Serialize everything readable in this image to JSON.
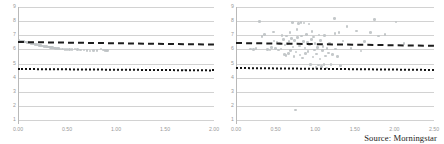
{
  "figure": {
    "source_note": "Source: Morningstar",
    "background": "#ffffff",
    "point_color": "#bfc3c6",
    "trend_color": "#1d1d1d",
    "grid_color": "#d2d2d2"
  },
  "chart_data": [
    {
      "id": "left-panel",
      "type": "scatter",
      "title": "",
      "xlabel": "",
      "ylabel": "",
      "xlim": [
        0.0,
        2.0
      ],
      "ylim": [
        1,
        9
      ],
      "grid": true,
      "legend": "none",
      "xticks": [
        "0.00",
        "0.50",
        "1.00",
        "1.50",
        "2.00"
      ],
      "xtick_values": [
        0.0,
        0.5,
        1.0,
        1.5,
        2.0
      ],
      "yticks": [
        "9",
        "8",
        "7",
        "6",
        "5",
        "4",
        "3",
        "2",
        "1"
      ],
      "ytick_values": [
        9,
        8,
        7,
        6,
        5,
        4,
        3,
        2,
        1
      ],
      "series": [
        {
          "name": "observations",
          "marker": "circle",
          "points": [
            [
              0.012,
              6.62
            ],
            [
              0.022,
              6.6
            ],
            [
              0.031,
              6.58
            ],
            [
              0.04,
              6.57
            ],
            [
              0.05,
              6.55
            ],
            [
              0.06,
              6.54
            ],
            [
              0.07,
              6.52
            ],
            [
              0.079,
              6.51
            ],
            [
              0.09,
              6.49
            ],
            [
              0.1,
              6.47
            ],
            [
              0.11,
              6.46
            ],
            [
              0.12,
              6.44
            ],
            [
              0.131,
              6.42
            ],
            [
              0.141,
              6.41
            ],
            [
              0.152,
              6.39
            ],
            [
              0.162,
              6.37
            ],
            [
              0.173,
              6.36
            ],
            [
              0.183,
              6.34
            ],
            [
              0.193,
              6.33
            ],
            [
              0.204,
              6.31
            ],
            [
              0.214,
              6.29
            ],
            [
              0.225,
              6.28
            ],
            [
              0.235,
              6.26
            ],
            [
              0.246,
              6.25
            ],
            [
              0.256,
              6.23
            ],
            [
              0.267,
              6.22
            ],
            [
              0.277,
              6.21
            ],
            [
              0.288,
              6.19
            ],
            [
              0.298,
              6.18
            ],
            [
              0.309,
              6.17
            ],
            [
              0.32,
              6.16
            ],
            [
              0.33,
              6.14
            ],
            [
              0.341,
              6.13
            ],
            [
              0.352,
              6.12
            ],
            [
              0.363,
              6.11
            ],
            [
              0.374,
              6.1
            ],
            [
              0.385,
              6.08
            ],
            [
              0.396,
              6.07
            ],
            [
              0.407,
              6.06
            ],
            [
              0.418,
              6.05
            ],
            [
              0.43,
              6.04
            ],
            [
              0.455,
              6.02
            ],
            [
              0.478,
              6.01
            ],
            [
              0.5,
              5.99
            ],
            [
              0.527,
              6.0
            ],
            [
              0.553,
              5.98
            ],
            [
              0.58,
              6.02
            ],
            [
              0.61,
              6.0
            ],
            [
              0.64,
              5.96
            ],
            [
              0.672,
              5.95
            ],
            [
              0.705,
              5.92
            ],
            [
              0.735,
              5.88
            ],
            [
              0.77,
              5.9
            ],
            [
              0.805,
              5.93
            ],
            [
              0.848,
              6.03
            ],
            [
              0.872,
              5.95
            ],
            [
              0.888,
              5.93
            ],
            [
              0.902,
              5.92
            ],
            [
              0.915,
              5.94
            ],
            [
              1.7,
              4.55
            ]
          ]
        }
      ],
      "reference_lines": [
        {
          "name": "mean-line",
          "style": "dashed",
          "y_start": 6.58,
          "y_end": 6.4
        },
        {
          "name": "threshold-line",
          "style": "dotted",
          "y_start": 4.68,
          "y_end": 4.58
        }
      ]
    },
    {
      "id": "right-panel",
      "type": "scatter",
      "title": "",
      "xlabel": "",
      "ylabel": "",
      "xlim": [
        0.0,
        2.5
      ],
      "ylim": [
        1,
        9
      ],
      "grid": true,
      "legend": "none",
      "xticks": [
        "0.00",
        "0.50",
        "1.00",
        "1.50",
        "2.00",
        "2.50"
      ],
      "xtick_values": [
        0.0,
        0.5,
        1.0,
        1.5,
        2.0,
        2.5
      ],
      "yticks": [
        "9",
        "8",
        "7",
        "6",
        "5",
        "4",
        "3",
        "2",
        "1"
      ],
      "ytick_values": [
        9,
        8,
        7,
        6,
        5,
        4,
        3,
        2,
        1
      ],
      "series": [
        {
          "name": "observations",
          "marker": "circle",
          "points": [
            [
              0.18,
              6.04
            ],
            [
              0.22,
              5.98
            ],
            [
              0.25,
              6.05
            ],
            [
              0.3,
              7.96
            ],
            [
              0.33,
              6.92
            ],
            [
              0.36,
              7.05
            ],
            [
              0.4,
              6.0
            ],
            [
              0.43,
              5.96
            ],
            [
              0.45,
              6.12
            ],
            [
              0.47,
              7.22
            ],
            [
              0.48,
              6.6
            ],
            [
              0.5,
              6.05
            ],
            [
              0.52,
              6.52
            ],
            [
              0.54,
              5.95
            ],
            [
              0.55,
              6.42
            ],
            [
              0.57,
              6.02
            ],
            [
              0.58,
              7.0
            ],
            [
              0.6,
              6.68
            ],
            [
              0.61,
              5.62
            ],
            [
              0.62,
              6.3
            ],
            [
              0.63,
              5.55
            ],
            [
              0.64,
              6.95
            ],
            [
              0.65,
              6.4
            ],
            [
              0.66,
              5.7
            ],
            [
              0.67,
              6.55
            ],
            [
              0.68,
              7.2
            ],
            [
              0.69,
              5.92
            ],
            [
              0.7,
              6.75
            ],
            [
              0.71,
              7.92
            ],
            [
              0.72,
              6.18
            ],
            [
              0.73,
              5.48
            ],
            [
              0.74,
              6.62
            ],
            [
              0.75,
              1.72
            ],
            [
              0.76,
              5.8
            ],
            [
              0.77,
              7.4
            ],
            [
              0.78,
              6.85
            ],
            [
              0.79,
              7.85
            ],
            [
              0.8,
              6.25
            ],
            [
              0.81,
              5.6
            ],
            [
              0.82,
              7.9
            ],
            [
              0.83,
              6.95
            ],
            [
              0.84,
              5.38
            ],
            [
              0.85,
              6.55
            ],
            [
              0.86,
              7.88
            ],
            [
              0.87,
              6.1
            ],
            [
              0.88,
              5.72
            ],
            [
              0.89,
              7.05
            ],
            [
              0.9,
              6.48
            ],
            [
              0.91,
              5.85
            ],
            [
              0.92,
              7.8
            ],
            [
              0.93,
              6.3
            ],
            [
              0.94,
              4.95
            ],
            [
              0.95,
              6.7
            ],
            [
              0.96,
              7.28
            ],
            [
              0.97,
              5.45
            ],
            [
              0.98,
              6.88
            ],
            [
              0.99,
              5.95
            ],
            [
              1.0,
              6.4
            ],
            [
              1.01,
              4.72
            ],
            [
              1.02,
              5.68
            ],
            [
              1.03,
              6.15
            ],
            [
              1.04,
              4.88
            ],
            [
              1.05,
              7.02
            ],
            [
              1.06,
              5.32
            ],
            [
              1.07,
              6.62
            ],
            [
              1.08,
              4.8
            ],
            [
              1.09,
              5.9
            ],
            [
              1.1,
              6.22
            ],
            [
              1.11,
              4.95
            ],
            [
              1.12,
              6.98
            ],
            [
              1.13,
              5.52
            ],
            [
              1.14,
              4.68
            ],
            [
              1.15,
              6.05
            ],
            [
              1.17,
              5.75
            ],
            [
              1.18,
              6.45
            ],
            [
              1.2,
              4.92
            ],
            [
              1.22,
              5.62
            ],
            [
              1.24,
              8.18
            ],
            [
              1.25,
              7.12
            ],
            [
              1.26,
              6.02
            ],
            [
              1.28,
              5.48
            ],
            [
              1.3,
              7.18
            ],
            [
              1.32,
              4.85
            ],
            [
              1.35,
              6.58
            ],
            [
              1.4,
              7.6
            ],
            [
              1.45,
              6.08
            ],
            [
              1.52,
              7.3
            ],
            [
              1.58,
              5.88
            ],
            [
              1.62,
              6.55
            ],
            [
              1.7,
              7.2
            ],
            [
              1.75,
              8.12
            ],
            [
              1.8,
              6.95
            ],
            [
              1.88,
              7.05
            ],
            [
              2.02,
              7.95
            ],
            [
              2.12,
              6.4
            ]
          ]
        }
      ],
      "reference_lines": [
        {
          "name": "mean-line",
          "style": "dashed",
          "y_start": 6.52,
          "y_end": 6.32
        },
        {
          "name": "threshold-line",
          "style": "dotted",
          "y_start": 4.72,
          "y_end": 4.58
        }
      ]
    }
  ]
}
